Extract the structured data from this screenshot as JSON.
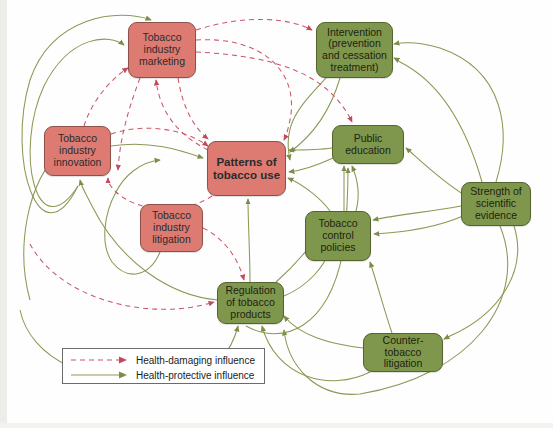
{
  "diagram": {
    "colors": {
      "health_damaging": "#cc5566",
      "health_protective": "#8a9a54",
      "node_red_fill": "#dd7b72",
      "node_red_border": "#8d5149",
      "node_green_fill": "#7f964d",
      "node_green_border": "#55632f",
      "background": "#fefefe"
    },
    "nodes": [
      {
        "id": "marketing",
        "label": "Tobacco industry marketing",
        "type": "health-damaging",
        "x": 128,
        "y": 22,
        "w": 68,
        "h": 56
      },
      {
        "id": "intervention",
        "label": "Intervention (prevention and cessation treatment)",
        "type": "health-protective",
        "x": 316,
        "y": 22,
        "w": 77,
        "h": 56
      },
      {
        "id": "innovation",
        "label": "Tobacco industry innovation",
        "type": "health-damaging",
        "x": 44,
        "y": 126,
        "w": 67,
        "h": 50
      },
      {
        "id": "patterns",
        "label": "Patterns of tobacco use",
        "type": "health-damaging",
        "x": 207,
        "y": 141,
        "w": 79,
        "h": 55,
        "central": true
      },
      {
        "id": "education",
        "label": "Public education",
        "type": "health-protective",
        "x": 332,
        "y": 125,
        "w": 72,
        "h": 39
      },
      {
        "id": "evidence",
        "label": "Strength of scientific evidence",
        "type": "health-protective",
        "x": 461,
        "y": 182,
        "w": 70,
        "h": 44
      },
      {
        "id": "litigation",
        "label": "Tobacco industry litigation",
        "type": "health-damaging",
        "x": 140,
        "y": 204,
        "w": 63,
        "h": 48
      },
      {
        "id": "control",
        "label": "Tobacco control policies",
        "type": "health-protective",
        "x": 305,
        "y": 211,
        "w": 66,
        "h": 50
      },
      {
        "id": "regulation",
        "label": "Regulation of tobacco products",
        "type": "health-protective",
        "x": 217,
        "y": 282,
        "w": 67,
        "h": 42
      },
      {
        "id": "counter",
        "label": "Counter-tobacco litigation",
        "type": "health-protective",
        "x": 363,
        "y": 333,
        "w": 80,
        "h": 39
      }
    ],
    "legend": {
      "items": [
        {
          "style": "dashed",
          "color": "#cc5566",
          "label": "Health-damaging influence"
        },
        {
          "style": "solid",
          "color": "#8a9a54",
          "label": "Health-protective influence"
        }
      ]
    },
    "edges": [
      {
        "from": "marketing",
        "to": "patterns",
        "influence": "health-damaging"
      },
      {
        "from": "marketing",
        "to": "intervention",
        "influence": "health-damaging"
      },
      {
        "from": "marketing",
        "to": "education",
        "influence": "health-damaging"
      },
      {
        "from": "innovation",
        "to": "marketing",
        "influence": "health-damaging"
      },
      {
        "from": "innovation",
        "to": "patterns",
        "influence": "health-damaging"
      },
      {
        "from": "litigation",
        "to": "regulation",
        "influence": "health-damaging"
      },
      {
        "from": "litigation",
        "to": "innovation",
        "influence": "health-damaging"
      },
      {
        "from": "patterns",
        "to": "marketing",
        "influence": "health-damaging"
      },
      {
        "from": "regulation",
        "to": "innovation",
        "influence": "health-damaging"
      },
      {
        "from": "intervention",
        "to": "patterns",
        "influence": "health-protective"
      },
      {
        "from": "education",
        "to": "patterns",
        "influence": "health-protective"
      },
      {
        "from": "education",
        "to": "intervention",
        "influence": "health-protective"
      },
      {
        "from": "control",
        "to": "patterns",
        "influence": "health-protective"
      },
      {
        "from": "control",
        "to": "education",
        "influence": "health-protective"
      },
      {
        "from": "regulation",
        "to": "patterns",
        "influence": "health-protective"
      },
      {
        "from": "regulation",
        "to": "control",
        "influence": "health-protective"
      },
      {
        "from": "counter",
        "to": "regulation",
        "influence": "health-protective"
      },
      {
        "from": "counter",
        "to": "control",
        "influence": "health-protective"
      },
      {
        "from": "evidence",
        "to": "intervention",
        "influence": "health-protective"
      },
      {
        "from": "evidence",
        "to": "education",
        "influence": "health-protective"
      },
      {
        "from": "evidence",
        "to": "control",
        "influence": "health-protective"
      },
      {
        "from": "evidence",
        "to": "regulation",
        "influence": "health-protective"
      },
      {
        "from": "evidence",
        "to": "counter",
        "influence": "health-protective"
      },
      {
        "from": "innovation",
        "to": "marketing",
        "influence": "health-protective"
      },
      {
        "from": "litigation",
        "to": "marketing",
        "influence": "health-protective"
      }
    ]
  }
}
